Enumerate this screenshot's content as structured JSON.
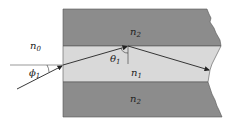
{
  "diagram": {
    "labels": {
      "n0": {
        "base": "n",
        "sub": "0"
      },
      "n1": {
        "base": "n",
        "sub": "1"
      },
      "n2_top": {
        "base": "n",
        "sub": "2"
      },
      "n2_bottom": {
        "base": "n",
        "sub": "2"
      },
      "phi1": {
        "base": "ϕ",
        "sub": "1"
      },
      "theta1": {
        "base": "θ",
        "sub": "1"
      }
    },
    "colors": {
      "cladding": "#8c8c8c",
      "core": "#d9d9d9",
      "ray": "#222222",
      "background": "#ffffff"
    }
  }
}
